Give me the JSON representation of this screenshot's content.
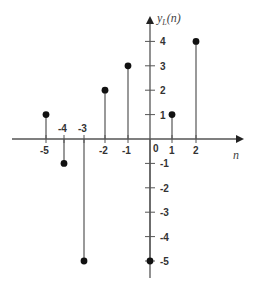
{
  "chart_data": {
    "type": "stem",
    "title": "",
    "xlabel": "n",
    "ylabel": "y_L(n)",
    "x": [
      -5,
      -4,
      -3,
      -2,
      -1,
      0,
      1,
      2
    ],
    "values": [
      1,
      -1,
      -5,
      2,
      3,
      -5,
      1,
      4
    ],
    "x_tick_labels": [
      "-5",
      "-4",
      "-3",
      "-2",
      "-1",
      "0",
      "1",
      "2"
    ],
    "y_tick_labels": [
      "4",
      "3",
      "2",
      "1",
      "-1",
      "-2",
      "-3",
      "-4",
      "-5"
    ],
    "y_ticks": [
      4,
      3,
      2,
      1,
      -1,
      -2,
      -3,
      -4,
      -5
    ],
    "xlim": [
      -6.5,
      4
    ],
    "ylim": [
      -5.5,
      5
    ],
    "grid": false,
    "legend": null
  },
  "labels": {
    "y_axis_main": "y",
    "y_axis_sub": "L",
    "y_axis_arg": "(n)",
    "x_axis": "n"
  },
  "colors": {
    "axis": "#555555",
    "stem": "#555555",
    "marker": "#111111",
    "text": "#333333"
  }
}
